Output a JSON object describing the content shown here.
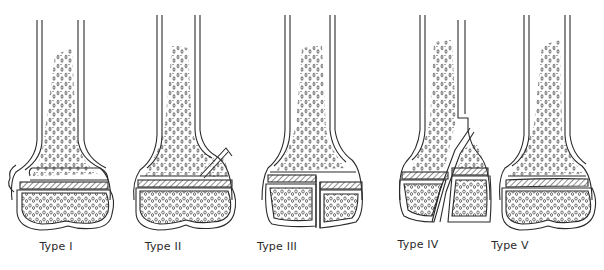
{
  "figure": {
    "panels": [
      {
        "id": "type-1",
        "label": "Type I",
        "label_x": 56,
        "label_y": 248
      },
      {
        "id": "type-2",
        "label": "Type II",
        "label_x": 163,
        "label_y": 248
      },
      {
        "id": "type-3",
        "label": "Type III",
        "label_x": 277,
        "label_y": 248
      },
      {
        "id": "type-4",
        "label": "Type IV",
        "label_x": 418,
        "label_y": 246
      },
      {
        "id": "type-5",
        "label": "Type V",
        "label_x": 510,
        "label_y": 247
      }
    ]
  },
  "colors": {
    "ink": "#2a2a2a",
    "physis_hatch": "#555555",
    "background": "#ffffff"
  }
}
